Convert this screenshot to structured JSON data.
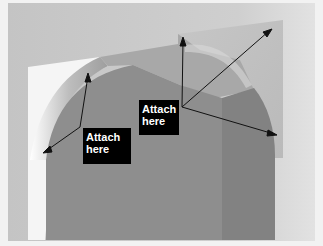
{
  "figure": {
    "colors": {
      "background": "#c9c9c9",
      "background_right": "#dcdcdc",
      "wall_white": "#f4f4f4",
      "arch_face": "#8c8c8c",
      "arch_face_right": "#7f7f7f",
      "ceiling": "#a2a2a2",
      "trim_panel": "#c2c2c2",
      "label_bg": "#000000",
      "label_text": "#ffffff",
      "arrow": "#111111"
    },
    "callouts": [
      {
        "id": "left",
        "line1": "Attach",
        "line2": "here",
        "arrows_to": [
          [
            88,
            73
          ],
          [
            43,
            153
          ]
        ]
      },
      {
        "id": "center",
        "line1": "Attach",
        "line2": "here",
        "arrows_to": [
          [
            183,
            37
          ],
          [
            272,
            29
          ],
          [
            277,
            135
          ]
        ]
      }
    ]
  }
}
